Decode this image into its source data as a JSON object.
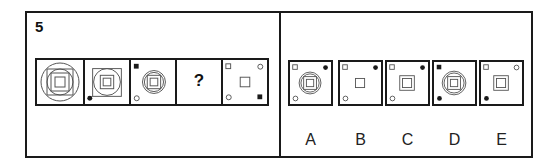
{
  "question": {
    "number": "5",
    "sequence": [
      {
        "id": "cell-1",
        "description": "nested large circle, square, circle, square, small square",
        "corners": {}
      },
      {
        "id": "cell-2",
        "description": "square containing circle, square, small square; black dot bottom-left connected by line",
        "corners": {
          "bottom_left": "black-dot"
        }
      },
      {
        "id": "cell-3",
        "description": "double circle containing square and small square",
        "corners": {
          "top_left": "black-square",
          "bottom_left": "open-circle"
        }
      },
      {
        "id": "cell-4",
        "placeholder": "?"
      },
      {
        "id": "cell-5",
        "description": "small square in center",
        "corners": {
          "top_left": "open-square",
          "top_right": "open-circle",
          "bottom_left": "open-circle",
          "bottom_right": "black-square"
        }
      }
    ]
  },
  "options": [
    {
      "label": "A",
      "corners": {
        "top_left": "open-square",
        "top_right": "black-dot",
        "bottom_left": "open-circle"
      },
      "center": "double circle with square and small square"
    },
    {
      "label": "B",
      "corners": {
        "top_left": "open-square",
        "top_right": "black-dot",
        "bottom_left": "open-circle"
      },
      "center": "small square"
    },
    {
      "label": "C",
      "corners": {
        "top_left": "open-square",
        "top_right": "black-dot",
        "bottom_left": "open-circle"
      },
      "center": "square with inner small square"
    },
    {
      "label": "D",
      "corners": {
        "top_left": "black-square",
        "bottom_left": "black-dot"
      },
      "center": "double circle with square and small square"
    },
    {
      "label": "E",
      "corners": {
        "top_left": "open-square",
        "top_right": "open-circle",
        "bottom_left": "black-dot"
      },
      "center": "square with inner small square"
    }
  ],
  "colors": {
    "stroke": "#1a1a1a",
    "line": "#555555",
    "background": "#ffffff"
  }
}
